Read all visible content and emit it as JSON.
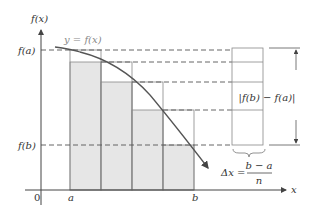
{
  "labels": {
    "y_axis": "f(x)",
    "x_axis": "x",
    "origin": "0",
    "fa": "f(a)",
    "fb": "f(b)",
    "a": "a",
    "b": "b",
    "curve": "y = f(x)",
    "difference": "|f(b) − f(a)|",
    "delta_lhs": "Δx =",
    "delta_num": "b − a",
    "delta_den": "n"
  },
  "colors": {
    "shade": "#e6e6e6",
    "line": "#555555",
    "dash": "#555555"
  }
}
